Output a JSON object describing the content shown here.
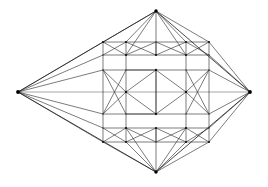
{
  "figure": {
    "kind": "line-drawing",
    "background_color": "#ffffff",
    "stroke_color": "#2b2b2b",
    "light_stroke_color": "#5d5d5d",
    "vertex_color": "#111111",
    "canvas": {
      "width": 268,
      "height": 187
    },
    "caption": ""
  },
  "geometry": {
    "apexes": {
      "left": {
        "x": 18,
        "y": 92,
        "label": "left-apex"
      },
      "right": {
        "x": 250,
        "y": 92,
        "label": "right-apex"
      },
      "top": {
        "x": 156,
        "y": 11,
        "label": "top-apex"
      },
      "bottom": {
        "x": 156,
        "y": 172,
        "label": "bottom-apex"
      }
    },
    "columns": [
      103,
      126,
      156,
      186,
      209
    ],
    "rows": {
      "upper_outer": 42,
      "upper_inner": 55,
      "middle_top": 70,
      "middle_axis": 92,
      "middle_bottom": 114,
      "lower_inner": 128,
      "lower_outer": 142
    },
    "counts": {
      "apex_nodes": 4,
      "grid_nodes": 22,
      "edges": 96,
      "bands": 3
    }
  }
}
